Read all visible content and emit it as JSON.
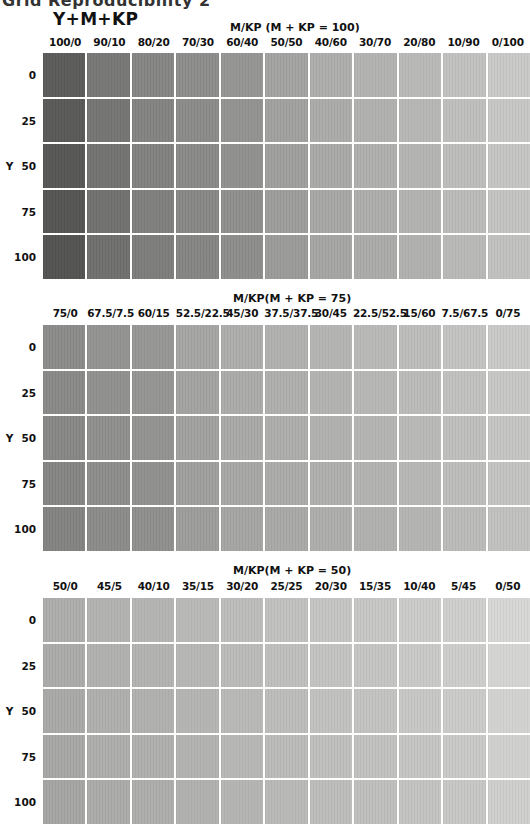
{
  "page": {
    "title": "Grid Reproducibility 2",
    "legend_title": "Y+M+KP"
  },
  "chart_data": [
    {
      "type": "heatmap",
      "title": "M/KP (M + KP = 100)",
      "xlabel": "M/KP",
      "ylabel": "Y",
      "categories": [
        "100/0",
        "90/10",
        "80/20",
        "70/30",
        "60/40",
        "50/50",
        "40/60",
        "30/70",
        "20/80",
        "10/90",
        "0/100"
      ],
      "rows": [
        "0",
        "25",
        "50",
        "75",
        "100"
      ],
      "base_colors": [
        "#5a5a5a",
        "#767676",
        "#848484",
        "#8c8c8c",
        "#949494",
        "#a2a2a2",
        "#acacac",
        "#b2b2b2",
        "#b8b8b8",
        "#c0c0c0",
        "#c8c8c8"
      ]
    },
    {
      "type": "heatmap",
      "title": "M/KP(M + KP = 75)",
      "xlabel": "M/KP",
      "ylabel": "Y",
      "categories": [
        "75/0",
        "67.5/7.5",
        "60/15",
        "52.5/22.5",
        "45/30",
        "37.5/37.5",
        "30/45",
        "22.5/52.5",
        "15/60",
        "7.5/67.5",
        "0/75"
      ],
      "rows": [
        "0",
        "25",
        "50",
        "75",
        "100"
      ],
      "base_colors": [
        "#8a8a8a",
        "#929292",
        "#969696",
        "#a4a4a4",
        "#acacac",
        "#b0b0b0",
        "#b4b4b4",
        "#b8b8b8",
        "#bcbcbc",
        "#c2c2c2",
        "#c8c8c8"
      ]
    },
    {
      "type": "heatmap",
      "title": "M/KP(M + KP = 50)",
      "xlabel": "M/KP",
      "ylabel": "Y",
      "categories": [
        "50/0",
        "45/5",
        "40/10",
        "35/15",
        "30/20",
        "25/25",
        "20/30",
        "15/35",
        "10/40",
        "5/45",
        "0/50"
      ],
      "rows": [
        "0",
        "25",
        "50",
        "75",
        "100"
      ],
      "base_colors": [
        "#acacac",
        "#b2b2b2",
        "#b4b4b4",
        "#b8b8b8",
        "#bcbcbc",
        "#c0c0c0",
        "#c4c4c4",
        "#c6c6c6",
        "#cacaca",
        "#cecece",
        "#d6d6d6"
      ]
    }
  ],
  "row_axis_prefix": "Y"
}
